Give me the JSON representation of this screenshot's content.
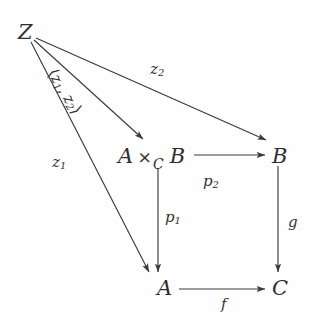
{
  "diagram": {
    "kind": "commutative-diagram",
    "ink_color": "#2e2e2e",
    "background_color": "#fefefe",
    "nodes": [
      {
        "id": "Z",
        "label": "Z",
        "x": 18,
        "y": 22
      },
      {
        "id": "AxCB",
        "label": "A ×_C B",
        "x": 118,
        "y": 148
      },
      {
        "id": "B",
        "label": "B",
        "x": 272,
        "y": 148
      },
      {
        "id": "A",
        "label": "A",
        "x": 155,
        "y": 280
      },
      {
        "id": "C",
        "label": "C",
        "x": 272,
        "y": 280
      }
    ],
    "fiber_product": {
      "left": "A",
      "times": "×",
      "subscript": "C",
      "right": "B"
    },
    "edges": [
      {
        "id": "z2",
        "from": "Z",
        "to": "B",
        "label": "z",
        "sub": "2",
        "label_x": 150,
        "label_y": 64
      },
      {
        "id": "pair",
        "from": "Z",
        "to": "AxCB",
        "label": "⟨z",
        "sub": "1, z₂⟩",
        "label_x": 58,
        "label_y": 66
      },
      {
        "id": "z1",
        "from": "Z",
        "to": "A",
        "label": "z",
        "sub": "1",
        "label_x": 52,
        "label_y": 157
      },
      {
        "id": "p2",
        "from": "AxCB",
        "to": "B",
        "label": "p",
        "sub": "2",
        "label_x": 203,
        "label_y": 177
      },
      {
        "id": "p1",
        "from": "AxCB",
        "to": "A",
        "label": "p",
        "sub": "1",
        "label_x": 163,
        "label_y": 213
      },
      {
        "id": "g",
        "from": "B",
        "to": "C",
        "label": "g",
        "sub": "",
        "label_x": 288,
        "label_y": 218
      },
      {
        "id": "f",
        "from": "A",
        "to": "C",
        "label": "f",
        "sub": "",
        "label_x": 223,
        "label_y": 300
      }
    ],
    "pair_label": {
      "open": "⟨",
      "first": "z",
      "first_sub": "1",
      "comma": ", ",
      "second": "z",
      "second_sub": "2",
      "close": "⟩"
    }
  }
}
